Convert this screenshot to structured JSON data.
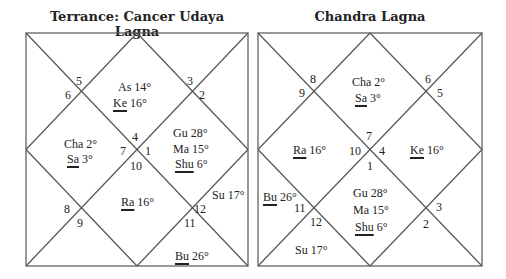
{
  "left_chart": {
    "title": "Terrance: Cancer Udaya Lagna",
    "house_numbers": {
      "n5": "5",
      "n6": "6",
      "n3": "3",
      "n2": "2",
      "n4": "4",
      "n7": "7",
      "n1": "1",
      "n10": "10",
      "n8": "8",
      "n9": "9",
      "n12": "12",
      "n11": "11"
    },
    "planets": {
      "as": "As 14°",
      "ke_name": "Ke",
      "ke_deg": " 16°",
      "gu": "Gu 28°",
      "ma": "Ma  15°",
      "shu_name": "Shu",
      "shu_deg": " 6°",
      "cha": "Cha 2°",
      "sa_name": "Sa",
      "sa_deg": " 3°",
      "ra_name": "Ra",
      "ra_deg": " 16°",
      "su": "Su 17°",
      "bu_name": "Bu",
      "bu_deg": " 26°"
    }
  },
  "right_chart": {
    "title": "Chandra Lagna",
    "house_numbers": {
      "n8": "8",
      "n9": "9",
      "n6": "6",
      "n5": "5",
      "n7": "7",
      "n10": "10",
      "n4": "4",
      "n1": "1",
      "n11": "11",
      "n12": "12",
      "n3": "3",
      "n2": "2"
    },
    "planets": {
      "cha": "Cha 2°",
      "sa_name": "Sa",
      "sa_deg": " 3°",
      "ra_name": "Ra",
      "ra_deg": " 16°",
      "ke_name": "Ke",
      "ke_deg": " 16°",
      "bu_name": "Bu",
      "bu_deg": " 26°",
      "gu": "Gu 28°",
      "ma": "Ma  15°",
      "shu_name": "Shu",
      "shu_deg": " 6°",
      "su": "Su 17°"
    }
  }
}
